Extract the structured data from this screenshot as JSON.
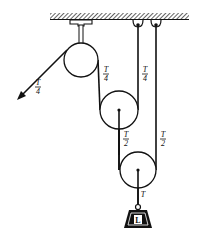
{
  "figure": {
    "type": "pulley-system",
    "ceiling": {
      "hatched": true
    },
    "labels": {
      "free_end_tension": {
        "num": "T",
        "den": "4"
      },
      "pulley1_right_tension": {
        "num": "T",
        "den": "4"
      },
      "pulley2_right_tension": {
        "num": "T",
        "den": "4"
      },
      "pulley2_axle_tension": {
        "num": "T",
        "den": "2"
      },
      "pulley3_right_tension": {
        "num": "T",
        "den": "2"
      },
      "load_tension": "T",
      "load": "L"
    },
    "colors": {
      "ink": "#111111",
      "background": "#ffffff"
    }
  }
}
